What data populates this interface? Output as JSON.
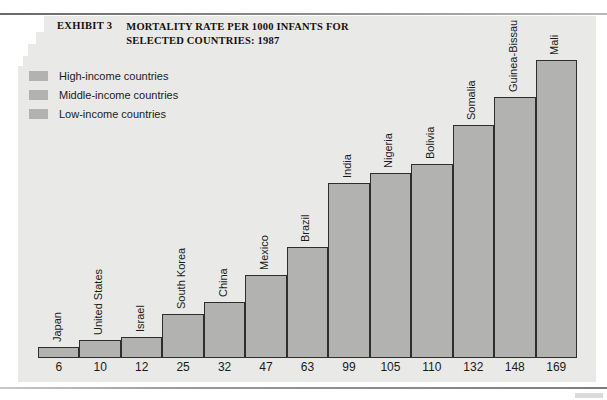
{
  "exhibit": {
    "label": "EXHIBIT 3",
    "title": "MORTALITY RATE PER 1000 INFANTS FOR SELECTED COUNTRIES: 1987"
  },
  "legend": {
    "position": "top-left",
    "items": [
      {
        "label": "High-income countries",
        "color": "#b2b2b0",
        "key": "high"
      },
      {
        "label": "Middle-income countries",
        "color": "#b2b2b0",
        "key": "middle"
      },
      {
        "label": "Low-income countries",
        "color": "#b2b2b0",
        "key": "low"
      }
    ]
  },
  "chart_data": {
    "type": "bar",
    "title": "MORTALITY RATE PER 1000 INFANTS FOR SELECTED COUNTRIES: 1987",
    "xlabel": "",
    "ylabel": "",
    "ylim": [
      0,
      169
    ],
    "grid": false,
    "legend_position": "top-left",
    "categories": [
      "Japan",
      "United States",
      "Israel",
      "South Korea",
      "China",
      "Mexico",
      "Brazil",
      "India",
      "Nigeria",
      "Bolivia",
      "Somalia",
      "Guinea-Bissau",
      "Mali"
    ],
    "values": [
      6,
      10,
      12,
      25,
      32,
      47,
      63,
      99,
      105,
      110,
      132,
      148,
      169
    ],
    "groups": [
      "high",
      "high",
      "high",
      "middle",
      "low",
      "middle",
      "middle",
      "low",
      "low",
      "middle",
      "low",
      "low",
      "low"
    ],
    "bar_color": "#b2b2b0",
    "bar_border_color": "#2e2e2e",
    "background": "#e9e9e7",
    "value_labels": [
      "6",
      "10",
      "12",
      "25",
      "32",
      "47",
      "63",
      "99",
      "105",
      "110",
      "132",
      "148",
      "169"
    ]
  }
}
